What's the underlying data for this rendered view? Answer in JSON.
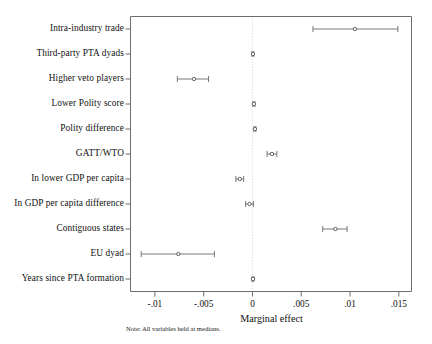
{
  "chart_data": {
    "type": "scatter",
    "title": "",
    "subtitle": "",
    "xlabel": "Marginal effect",
    "ylabel": "",
    "xlim": [
      -0.0125,
      0.0163
    ],
    "xticks": [
      -0.01,
      -0.005,
      0,
      0.005,
      0.01,
      0.015
    ],
    "xticklabels": [
      "-.01",
      "-.005",
      "0",
      ".005",
      ".01",
      ".015"
    ],
    "grid": false,
    "legend": null,
    "note": "Note: All variables held at medians.",
    "reference_line": 0,
    "orientation": "horizontal",
    "marker": "hollow-circle",
    "error_bars": "capped",
    "categories": [
      "Intra-industry trade",
      "Third-party PTA dyads",
      "Higher veto players",
      "Lower Polity score",
      "Polity difference",
      "GATT/WTO",
      "In lower GDP per capita",
      "In GDP per capita difference",
      "Contiguous states",
      "EU dyad",
      "Years since PTA formation"
    ],
    "points": [
      {
        "label": "Intra-industry trade",
        "estimate": 0.0105,
        "ci_low": 0.0062,
        "ci_high": 0.0149
      },
      {
        "label": "Third-party PTA dyads",
        "estimate": 5e-05,
        "ci_low": -5e-05,
        "ci_high": 0.00015
      },
      {
        "label": "Higher veto players",
        "estimate": -0.006,
        "ci_low": -0.0077,
        "ci_high": -0.0045
      },
      {
        "label": "Lower Polity score",
        "estimate": 0.00015,
        "ci_low": 5e-05,
        "ci_high": 0.00025
      },
      {
        "label": "Polity difference",
        "estimate": 0.00025,
        "ci_low": 0.00015,
        "ci_high": 0.00035
      },
      {
        "label": "GATT/WTO",
        "estimate": 0.002,
        "ci_low": 0.0015,
        "ci_high": 0.0025
      },
      {
        "label": "In lower GDP per capita",
        "estimate": -0.0013,
        "ci_low": -0.0017,
        "ci_high": -0.0009
      },
      {
        "label": "In GDP per capita difference",
        "estimate": -0.0003,
        "ci_low": -0.0007,
        "ci_high": 0.0001
      },
      {
        "label": "Contiguous states",
        "estimate": 0.0085,
        "ci_low": 0.0072,
        "ci_high": 0.0097
      },
      {
        "label": "EU dyad",
        "estimate": -0.0076,
        "ci_low": -0.0114,
        "ci_high": -0.0039
      },
      {
        "label": "Years since PTA formation",
        "estimate": 5e-05,
        "ci_low": -5e-05,
        "ci_high": 0.00015
      }
    ]
  },
  "colors": {
    "axis": "#6f6f6f",
    "marker": "#555555",
    "line": "#6a6a6a",
    "text": "#111111",
    "reference": "#d2d2d2"
  }
}
